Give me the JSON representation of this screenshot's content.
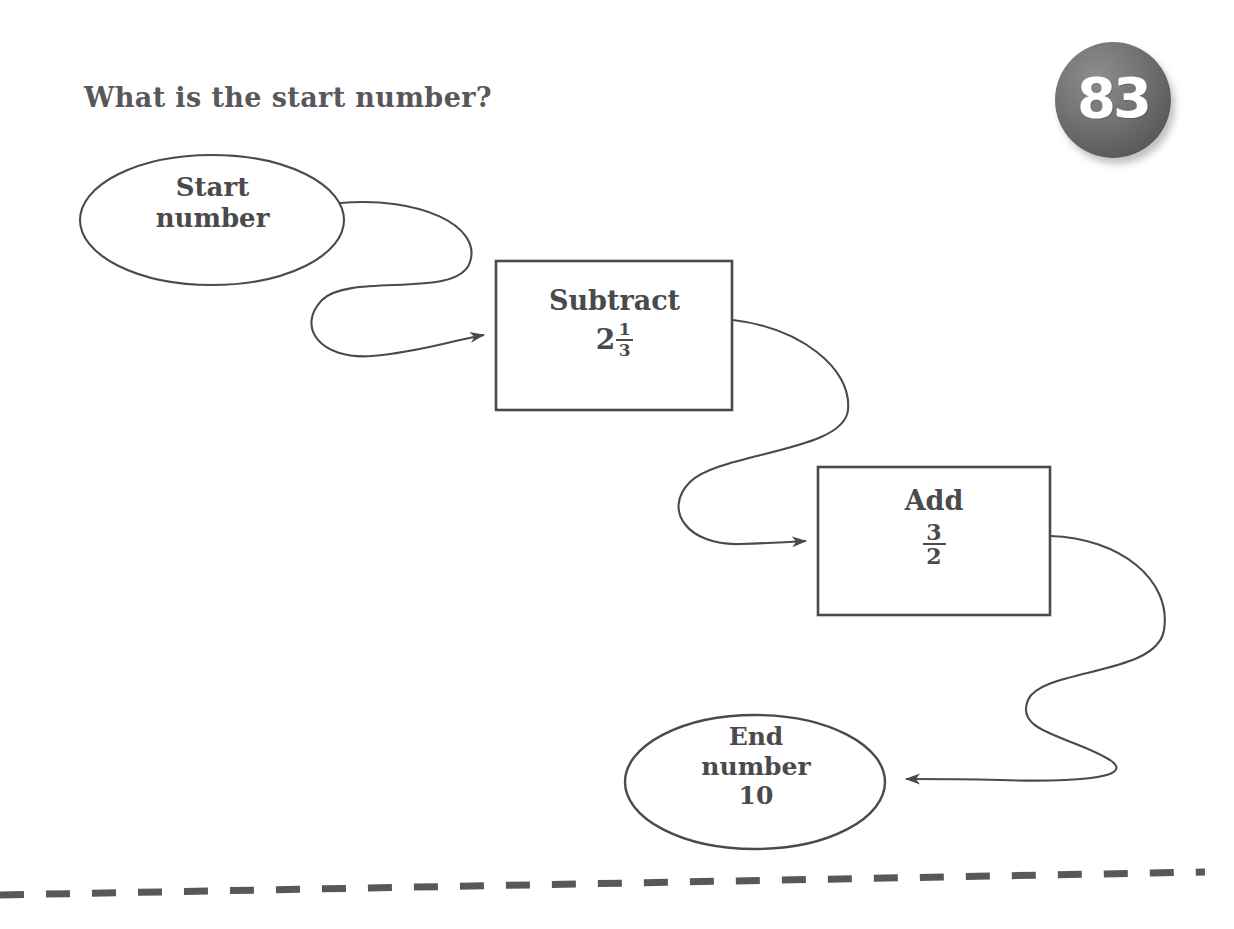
{
  "page": {
    "question": "What is the start number?",
    "badge_number": "83",
    "ink_color": "#4a4a4c",
    "title_color": "#58585a",
    "badge_color": "#5d5d60",
    "background": "#ffffff"
  },
  "flow": {
    "start_node": {
      "shape": "ellipse",
      "line1": "Start",
      "line2": "number"
    },
    "steps": [
      {
        "shape": "rectangle",
        "operation": "Subtract",
        "value_type": "mixed-number",
        "whole": "2",
        "numerator": "1",
        "denominator": "3",
        "value_text": "2 1/3"
      },
      {
        "shape": "rectangle",
        "operation": "Add",
        "value_type": "fraction",
        "whole": "",
        "numerator": "3",
        "denominator": "2",
        "value_text": "3/2"
      }
    ],
    "end_node": {
      "shape": "ellipse",
      "line1": "End",
      "line2": "number",
      "line3": "10"
    },
    "connectors": [
      {
        "from": "start_node",
        "to": "subtract_box",
        "style": "s-curve-arrow"
      },
      {
        "from": "subtract_box",
        "to": "add_box",
        "style": "s-curve-arrow"
      },
      {
        "from": "add_box",
        "to": "end_node",
        "style": "s-curve-arrow"
      }
    ]
  },
  "footer": {
    "cut_line": "dashed"
  }
}
